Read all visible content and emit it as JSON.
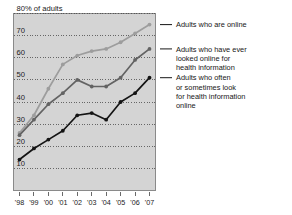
{
  "chart_data": {
    "type": "line",
    "title": "",
    "xlabel": "",
    "ylabel": "80% of adults",
    "ylim": [
      0,
      80
    ],
    "xlim": [
      "'98",
      "'07"
    ],
    "grid": true,
    "legend_position": "right",
    "axis_top_label": "80% of adults",
    "categories": [
      "'98",
      "'99",
      "'00",
      "'01",
      "'02",
      "'03",
      "'04",
      "'05",
      "'06",
      "'07"
    ],
    "ytick_labels": [
      "80% of adults",
      "70",
      "60",
      "50",
      "40",
      "30",
      "20",
      "10"
    ],
    "ytick_values": [
      80,
      70,
      60,
      50,
      40,
      30,
      20,
      10
    ],
    "series": [
      {
        "name": "Adults who are online",
        "color": "#9d9d9d",
        "values": [
          26,
          34,
          46,
          57,
          61,
          63,
          64,
          67,
          71,
          75
        ]
      },
      {
        "name": "Adults who have ever looked online for health information",
        "color": "#636363",
        "values": [
          25,
          32,
          39,
          44,
          50,
          47,
          47,
          51,
          59,
          64
        ]
      },
      {
        "name": "Adults who often or sometimes look for health information online",
        "color": "#141414",
        "values": [
          14,
          19,
          23,
          27,
          34,
          35,
          32,
          40,
          44,
          51
        ]
      }
    ]
  },
  "legend": {
    "items": [
      {
        "lines": [
          "Adults who are online"
        ]
      },
      {
        "lines": [
          "Adults who have ever",
          "looked online for",
          "health information"
        ]
      },
      {
        "lines": [
          "Adults who often",
          "or sometimes look",
          "for health information",
          "online"
        ]
      }
    ]
  },
  "colors": {
    "plot_background": "#d4d4d4",
    "plot_border": "#8a8a8a",
    "gridline": "#4a4a4a",
    "series_online": "#9d9d9d",
    "series_ever_looked": "#636363",
    "series_often": "#141414",
    "text": "#161616"
  }
}
